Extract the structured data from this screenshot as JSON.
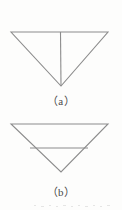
{
  "page": {
    "background_color": "#fdfdfc",
    "ink_color": "#8c8c8c",
    "caption_color": "#4a4a4a",
    "width": 122,
    "height": 210
  },
  "figures": [
    {
      "id": "figure-a",
      "caption": "（a）",
      "description": "inverted-triangle-with-vertical-median",
      "shape": "inverted-triangle",
      "vertices": {
        "top_left": [
          11,
          10
        ],
        "top_right": [
          108,
          10
        ],
        "apex": [
          61,
          64
        ]
      },
      "internal_line": {
        "name": "vertical-median-line",
        "orientation": "vertical",
        "from": [
          60,
          10
        ],
        "to": [
          61,
          64
        ]
      }
    },
    {
      "id": "figure-b",
      "caption": "（b）",
      "description": "inverted-triangle-with-horizontal-midsegment",
      "shape": "inverted-triangle",
      "vertices": {
        "top_left": [
          11,
          10
        ],
        "top_right": [
          108,
          10
        ],
        "apex": [
          61,
          58
        ]
      },
      "internal_line": {
        "name": "horizontal-midsegment-line",
        "orientation": "horizontal",
        "from": [
          30,
          34
        ],
        "to": [
          88,
          34
        ]
      }
    }
  ]
}
